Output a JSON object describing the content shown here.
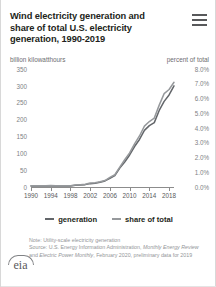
{
  "header": {
    "title": "Wind electricity generation and share of total U.S. electricity generation, 1990-2019",
    "menu_icon": "hamburger-menu-icon"
  },
  "footer": {
    "note": "Note: Utility-scale electricity generation",
    "source_line1": "Source: U.S. Energy Information Administration, ",
    "source_italic1": "Monthly",
    "source_italic2": "Energy Review",
    "source_mid": " and ",
    "source_italic3": "Electric Power Monthly",
    "source_line3": ", February 2020,",
    "source_line4": "preliminary data for 2019",
    "logo_text": "eia"
  },
  "colors": {
    "generation_line": "#63666a",
    "share_line": "#8c8f93",
    "axis": "#8c8c8c",
    "title_text": "#231f20",
    "muted_text": "#939598"
  },
  "chart_data": {
    "type": "line",
    "title": "Wind electricity generation and share of total U.S. electricity generation, 1990-2019",
    "left_axis_label": "billion kilowatthours",
    "right_axis_label": "percent of total",
    "xlabel": "",
    "grid": false,
    "legend_position": "bottom-center",
    "x": [
      1990,
      1991,
      1992,
      1993,
      1994,
      1995,
      1996,
      1997,
      1998,
      1999,
      2000,
      2001,
      2002,
      2003,
      2004,
      2005,
      2006,
      2007,
      2008,
      2009,
      2010,
      2011,
      2012,
      2013,
      2014,
      2015,
      2016,
      2017,
      2018,
      2019
    ],
    "xticks": [
      "1990",
      "1994",
      "1998",
      "2002",
      "2006",
      "2010",
      "2014",
      "2018"
    ],
    "left_ticks": [
      "0",
      "50",
      "100",
      "150",
      "200",
      "250",
      "300",
      "350"
    ],
    "right_ticks": [
      "0.0%",
      "1.0%",
      "2.0%",
      "3.0%",
      "4.0%",
      "5.0%",
      "6.0%",
      "7.0%",
      "8.0%"
    ],
    "ylim": [
      0,
      350
    ],
    "y2lim": [
      0,
      8
    ],
    "series": [
      {
        "name": "generation",
        "axis": "left",
        "units": "billion kilowatthours",
        "values": [
          3,
          3,
          3,
          3,
          4,
          3,
          3,
          3,
          3,
          5,
          6,
          7,
          10,
          11,
          14,
          18,
          26,
          34,
          56,
          74,
          95,
          120,
          141,
          168,
          182,
          191,
          227,
          254,
          273,
          300
        ]
      },
      {
        "name": "share of total",
        "axis": "right",
        "units": "percent of total",
        "values": [
          0.09,
          0.09,
          0.09,
          0.09,
          0.11,
          0.08,
          0.08,
          0.08,
          0.08,
          0.13,
          0.15,
          0.19,
          0.27,
          0.29,
          0.36,
          0.44,
          0.65,
          0.83,
          1.35,
          1.85,
          2.31,
          2.92,
          3.46,
          4.13,
          4.44,
          4.67,
          5.55,
          6.33,
          6.61,
          7.1
        ]
      }
    ],
    "legend": [
      "generation",
      "share of total"
    ]
  }
}
